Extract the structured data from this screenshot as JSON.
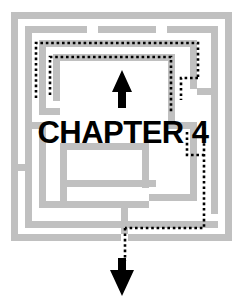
{
  "figure": {
    "kind": "chapter-opener-maze-illustration",
    "title_text": "CHAPTER 4",
    "chapter_number": "4",
    "background_color": "#ffffff",
    "wall_color": "#c0c0c0",
    "path_color": "#000000",
    "title_color": "#000000",
    "width": 246,
    "height": 305
  },
  "maze": {
    "name": "square-maze",
    "outer_bounds": {
      "x": 11,
      "y": 12,
      "width": 221,
      "height": 229
    },
    "wall_thickness": 7,
    "walls": [
      {
        "name": "outer-border-left",
        "x": 11,
        "y": 12,
        "w": 7,
        "h": 229
      },
      {
        "name": "outer-border-top",
        "x": 11,
        "y": 12,
        "w": 221,
        "h": 7
      },
      {
        "name": "outer-border-right",
        "x": 225,
        "y": 12,
        "w": 7,
        "h": 229
      },
      {
        "name": "outer-border-bottom-left",
        "x": 11,
        "y": 234,
        "w": 110,
        "h": 7
      },
      {
        "name": "outer-border-bottom-right",
        "x": 128,
        "y": 234,
        "w": 104,
        "h": 7
      },
      {
        "name": "ring2-left",
        "x": 25,
        "y": 26,
        "w": 7,
        "h": 202
      },
      {
        "name": "ring2-top-a",
        "x": 25,
        "y": 26,
        "w": 62,
        "h": 7
      },
      {
        "name": "ring2-top-b",
        "x": 98,
        "y": 26,
        "w": 58,
        "h": 7
      },
      {
        "name": "ring2-top-c",
        "x": 167,
        "y": 26,
        "w": 51,
        "h": 7
      },
      {
        "name": "ring2-right",
        "x": 211,
        "y": 26,
        "w": 7,
        "h": 188
      },
      {
        "name": "ring2-bottom",
        "x": 25,
        "y": 221,
        "w": 193,
        "h": 7
      },
      {
        "name": "ring3-left",
        "x": 39,
        "y": 40,
        "w": 7,
        "h": 75
      },
      {
        "name": "ring3-top",
        "x": 39,
        "y": 40,
        "w": 158,
        "h": 7
      },
      {
        "name": "ring3-right",
        "x": 190,
        "y": 40,
        "w": 7,
        "h": 49
      },
      {
        "name": "ring4-left",
        "x": 53,
        "y": 54,
        "w": 7,
        "h": 47
      },
      {
        "name": "ring4-top",
        "x": 53,
        "y": 54,
        "w": 122,
        "h": 7
      },
      {
        "name": "ring4-right",
        "x": 168,
        "y": 54,
        "w": 7,
        "h": 75
      },
      {
        "name": "stub-upper-left-foot",
        "x": 39,
        "y": 108,
        "w": 21,
        "h": 7
      },
      {
        "name": "stub-left-mid",
        "x": 25,
        "y": 122,
        "w": 21,
        "h": 7
      },
      {
        "name": "inner-left-col",
        "x": 39,
        "y": 122,
        "w": 7,
        "h": 86
      },
      {
        "name": "inner-left-foot",
        "x": 39,
        "y": 201,
        "w": 110,
        "h": 7
      },
      {
        "name": "inner-mid-col",
        "x": 60,
        "y": 143,
        "w": 7,
        "h": 65
      },
      {
        "name": "inner-mid-foot",
        "x": 60,
        "y": 180,
        "w": 96,
        "h": 7
      },
      {
        "name": "inner-mid-top",
        "x": 60,
        "y": 143,
        "w": 82,
        "h": 7
      },
      {
        "name": "inner-right-col",
        "x": 142,
        "y": 143,
        "w": 7,
        "h": 45
      },
      {
        "name": "right-inner-col",
        "x": 190,
        "y": 122,
        "w": 7,
        "h": 79
      },
      {
        "name": "right-inner-foot",
        "x": 149,
        "y": 194,
        "w": 48,
        "h": 7
      },
      {
        "name": "right-notch-a",
        "x": 175,
        "y": 122,
        "w": 22,
        "h": 7
      },
      {
        "name": "right-notch-b",
        "x": 197,
        "y": 88,
        "w": 21,
        "h": 7
      },
      {
        "name": "left-notch-low",
        "x": 11,
        "y": 164,
        "w": 21,
        "h": 7
      },
      {
        "name": "bottom-stub",
        "x": 121,
        "y": 208,
        "w": 7,
        "h": 26
      }
    ]
  },
  "solution_path": {
    "name": "dotted-solution-path",
    "style": "dotted",
    "dot_size": 2.6,
    "color": "#000000",
    "segments": [
      {
        "name": "path-outer-upper-left-vertical",
        "points": "36,98 36,43 198,43 198,78"
      },
      {
        "name": "path-inner-upper-left-vertical",
        "points": "50,95 50,57 171,57 171,113"
      },
      {
        "name": "path-right-vertical-descent",
        "points": "198,78 180,78 180,100"
      },
      {
        "name": "path-right-small-hook",
        "points": "187,131 187,155 205,155"
      },
      {
        "name": "path-right-outer-descent",
        "points": "205,128 205,228 125,228"
      },
      {
        "name": "path-exit-vertical",
        "points": "125,228 125,262"
      }
    ]
  },
  "arrows": [
    {
      "name": "entry-arrow-up",
      "direction": "up",
      "x": 122,
      "y_top": 72,
      "y_bottom": 107,
      "color": "#000000"
    },
    {
      "name": "exit-arrow-down",
      "direction": "down",
      "x": 122,
      "y_top": 258,
      "y_bottom": 295,
      "color": "#000000"
    }
  ]
}
